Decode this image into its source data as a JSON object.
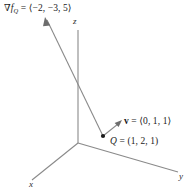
{
  "figure": {
    "name": "gradient-and-direction-vector-3d-axes",
    "background_color": "#ffffff",
    "line_color": "#8a8a8a",
    "text_color": "#1a1a1a",
    "width": 194,
    "height": 192
  },
  "axes": {
    "origin": {
      "x": 78,
      "y": 143
    },
    "x_axis": {
      "label": "x",
      "end_x": 32,
      "end_y": 180
    },
    "y_axis": {
      "label": "y",
      "end_x": 178,
      "end_y": 172
    },
    "z_axis": {
      "label": "z",
      "end_x": 78,
      "end_y": 30
    }
  },
  "point": {
    "label_symbol": "Q",
    "label_equals": " = (1, 2, 1)",
    "label_full": "Q = (1, 2, 1)",
    "x": 103,
    "y": 136
  },
  "gradient_vector": {
    "label_symbol": "∇f",
    "label_subscript": "Q",
    "label_equals": " = ⟨−2, −3, 5⟩",
    "label_full": "∇f_Q = ⟨−2, −3, 5⟩",
    "components": [
      -2,
      -3,
      5
    ],
    "tail_x": 103,
    "tail_y": 136,
    "tip_x": 45,
    "tip_y": 18
  },
  "direction_vector": {
    "label_symbol": "v",
    "label_equals": " = ⟨0, 1, 1⟩",
    "label_full": "v = ⟨0, 1, 1⟩",
    "components": [
      0,
      1,
      1
    ],
    "tail_x": 103,
    "tail_y": 136,
    "tip_x": 121,
    "tip_y": 121
  }
}
